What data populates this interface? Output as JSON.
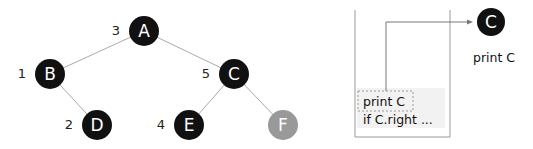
{
  "tree": {
    "edge_color": "#aaaaaa",
    "nodes": [
      {
        "id": "A",
        "label": "A",
        "order": "3",
        "cx": 144,
        "cy": 31,
        "fill": "#111111"
      },
      {
        "id": "B",
        "label": "B",
        "order": "1",
        "cx": 50,
        "cy": 74,
        "fill": "#111111"
      },
      {
        "id": "C",
        "label": "C",
        "order": "5",
        "cx": 234,
        "cy": 74,
        "fill": "#111111"
      },
      {
        "id": "D",
        "label": "D",
        "order": "2",
        "cx": 97,
        "cy": 125,
        "fill": "#111111"
      },
      {
        "id": "E",
        "label": "E",
        "order": "4",
        "cx": 189,
        "cy": 125,
        "fill": "#111111"
      },
      {
        "id": "F",
        "label": "F",
        "order": "",
        "cx": 283,
        "cy": 125,
        "fill": "#999999"
      }
    ],
    "edges": [
      [
        "A",
        "B"
      ],
      [
        "A",
        "C"
      ],
      [
        "B",
        "D"
      ],
      [
        "C",
        "E"
      ],
      [
        "C",
        "F"
      ]
    ]
  },
  "stack": {
    "frame_line1": "print C",
    "frame_line2": "if C.right ..."
  },
  "current": {
    "node_label": "C",
    "caption": "print C"
  }
}
